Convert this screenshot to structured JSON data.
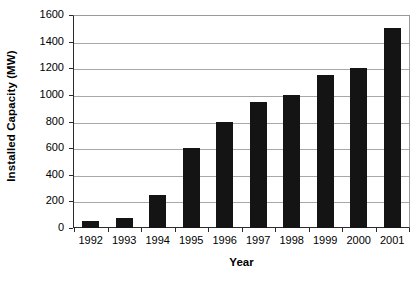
{
  "chart_data": {
    "type": "bar",
    "title": "",
    "xlabel": "Year",
    "ylabel": "Installed Capacity (MW)",
    "categories": [
      "1992",
      "1993",
      "1994",
      "1995",
      "1996",
      "1997",
      "1998",
      "1999",
      "2000",
      "2001"
    ],
    "values": [
      50,
      75,
      250,
      600,
      800,
      950,
      1000,
      1150,
      1200,
      1500
    ],
    "ylim": [
      0,
      1600
    ],
    "yticks": [
      0,
      200,
      400,
      600,
      800,
      1000,
      1200,
      1400,
      1600
    ],
    "ytick_labels": [
      "0",
      "200",
      "400",
      "600",
      "800",
      "1000",
      "1200",
      "1400",
      "1600"
    ],
    "grid": true,
    "grid_axis": "y",
    "legend": false,
    "legend_position": "none",
    "bar_color": "#141414",
    "plot_background": "#ffffff",
    "gridline_color": "#a8a8a8",
    "axis_color": "#2b2b2b"
  }
}
